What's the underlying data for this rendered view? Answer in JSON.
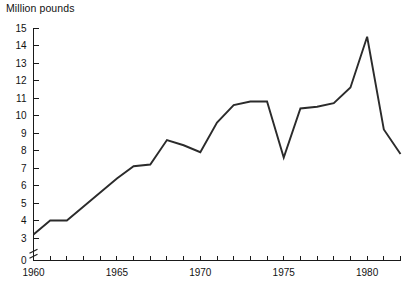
{
  "chart_data": {
    "type": "line",
    "title": "Million pounds",
    "xlabel": "",
    "ylabel": "Million pounds",
    "grid": false,
    "legend": null,
    "axis_break": true,
    "axis_break_note": "y-axis broken between 0 and 3",
    "xlim": [
      1960,
      1982
    ],
    "ylim": [
      3,
      15
    ],
    "y_ticks": [
      0,
      3,
      4,
      5,
      6,
      7,
      8,
      9,
      10,
      11,
      12,
      13,
      14,
      15
    ],
    "y_tick_labels": [
      "0",
      "3",
      "4",
      "5",
      "6",
      "7",
      "8",
      "9",
      "10",
      "11",
      "12",
      "13",
      "14",
      "15"
    ],
    "x_ticks": [
      1960,
      1961,
      1962,
      1963,
      1964,
      1965,
      1966,
      1967,
      1968,
      1969,
      1970,
      1971,
      1972,
      1973,
      1974,
      1975,
      1976,
      1977,
      1978,
      1979,
      1980,
      1981,
      1982
    ],
    "x_tick_labels": [
      "1960",
      "",
      "",
      "",
      "",
      "1965",
      "",
      "",
      "",
      "",
      "1970",
      "",
      "",
      "",
      "",
      "1975",
      "",
      "",
      "",
      "",
      "1980",
      "",
      ""
    ],
    "x": [
      1960,
      1961,
      1962,
      1963,
      1964,
      1965,
      1966,
      1967,
      1968,
      1969,
      1970,
      1971,
      1972,
      1973,
      1974,
      1975,
      1976,
      1977,
      1978,
      1979,
      1980,
      1981,
      1982
    ],
    "values": [
      3.2,
      4.0,
      4.0,
      4.8,
      5.6,
      6.4,
      7.1,
      7.2,
      8.6,
      8.3,
      7.9,
      9.6,
      10.6,
      10.8,
      10.8,
      7.6,
      10.4,
      10.5,
      10.7,
      11.6,
      14.5,
      9.2,
      7.8
    ],
    "series": [
      {
        "name": "Million pounds",
        "color": "#2b2b2b",
        "values": [
          3.2,
          4.0,
          4.0,
          4.8,
          5.6,
          6.4,
          7.1,
          7.2,
          8.6,
          8.3,
          7.9,
          9.6,
          10.6,
          10.8,
          10.8,
          7.6,
          10.4,
          10.5,
          10.7,
          11.6,
          14.5,
          9.2,
          7.8
        ]
      }
    ]
  },
  "labels": {
    "title": "Million pounds"
  }
}
